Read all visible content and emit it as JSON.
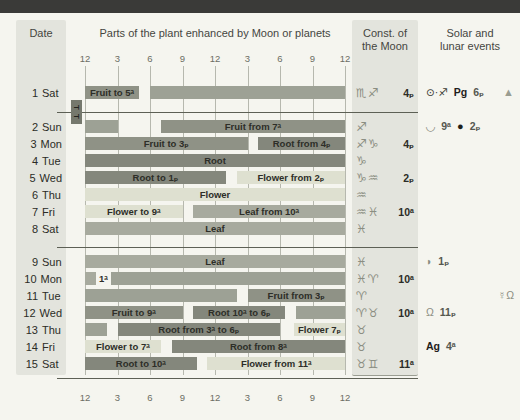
{
  "header": {
    "date_label": "Date",
    "plant_label": "Parts of the plant enhanced by Moon or planets",
    "const_line1": "Const. of",
    "const_line2": "the Moon",
    "events_line1": "Solar and",
    "events_line2": "lunar events"
  },
  "axis": {
    "labels": [
      "12",
      "3",
      "6",
      "9",
      "12",
      "3",
      "6",
      "9",
      "12"
    ],
    "hours": [
      0,
      3,
      6,
      9,
      12,
      15,
      18,
      21,
      24
    ]
  },
  "tt_marker": {
    "label": "T T"
  },
  "colors": {
    "fruit": "#8f9286",
    "root": "#84877c",
    "flower": "#dee0d0",
    "leaf": "#a7aa9e",
    "unfavorable": "#9da195",
    "header_bar": "#3a3a38",
    "column_band": "#e3e4dd",
    "grid": "#b6b8ae",
    "separator": "#5d6055",
    "symbol": "#8b8e82"
  },
  "rows": [
    {
      "date_num": "1",
      "date_day": "Sat",
      "bars": [
        {
          "type": "fruit",
          "from": 0,
          "to": 5,
          "label": "Fruit to 5ᵃ"
        },
        {
          "type": "gray",
          "from": 6,
          "to": 24,
          "label": ""
        }
      ],
      "constellation": {
        "signs": "♏♐",
        "time": "4ₚ"
      },
      "events": [
        {
          "n": "sun-into-sagittarius",
          "t": "⊙·♐",
          "k": "dark"
        },
        {
          "n": "perigee-label",
          "t": "Pg",
          "k": "bold"
        },
        {
          "n": "perigee-time",
          "t": "6ₚ",
          "k": "time"
        },
        {
          "n": "warning-triangle-icon",
          "t": "▲",
          "k": "sym tri right"
        }
      ]
    },
    {
      "date_num": "2",
      "date_day": "Sun",
      "bars": [
        {
          "type": "gray",
          "from": 0,
          "to": 3,
          "label": ""
        },
        {
          "type": "fruit",
          "from": 7,
          "to": 24,
          "label": "Fruit from 7ᵃ"
        }
      ],
      "constellation": {
        "signs": "♐",
        "time": ""
      },
      "events": [
        {
          "n": "eclipse-icon",
          "t": "◡",
          "k": "sym big"
        },
        {
          "n": "eclipse-time",
          "t": "9ᵃ",
          "k": "time"
        },
        {
          "n": "new-moon-icon",
          "t": "●",
          "k": "moon"
        },
        {
          "n": "new-moon-time",
          "t": "2ₚ",
          "k": "time"
        }
      ]
    },
    {
      "date_num": "3",
      "date_day": "Mon",
      "bars": [
        {
          "type": "fruit",
          "from": 0,
          "to": 15,
          "label": "Fruit to 3ₚ"
        },
        {
          "type": "root",
          "from": 16,
          "to": 24,
          "label": "Root from 4ₚ"
        }
      ],
      "constellation": {
        "signs": "♐♑",
        "time": "4ₚ"
      },
      "events": []
    },
    {
      "date_num": "4",
      "date_day": "Tue",
      "bars": [
        {
          "type": "root",
          "from": 0,
          "to": 24,
          "label": "Root"
        }
      ],
      "constellation": {
        "signs": "♑",
        "time": ""
      },
      "events": []
    },
    {
      "date_num": "5",
      "date_day": "Wed",
      "bars": [
        {
          "type": "root",
          "from": 0,
          "to": 13,
          "label": "Root to 1ₚ"
        },
        {
          "type": "flower",
          "from": 14,
          "to": 24,
          "label": "Flower from 2ₚ"
        }
      ],
      "constellation": {
        "signs": "♑♒",
        "time": "2ₚ"
      },
      "events": []
    },
    {
      "date_num": "6",
      "date_day": "Thu",
      "bars": [
        {
          "type": "flower",
          "from": 0,
          "to": 24,
          "label": "Flower"
        }
      ],
      "constellation": {
        "signs": "♒",
        "time": ""
      },
      "events": []
    },
    {
      "date_num": "7",
      "date_day": "Fri",
      "bars": [
        {
          "type": "flower",
          "from": 0,
          "to": 9,
          "label": "Flower to 9ᵃ"
        },
        {
          "type": "leaf",
          "from": 10,
          "to": 24,
          "label": "Leaf from 10ᵃ"
        }
      ],
      "constellation": {
        "signs": "♒♓",
        "time": "10ᵃ"
      },
      "events": []
    },
    {
      "date_num": "8",
      "date_day": "Sat",
      "bars": [
        {
          "type": "leaf",
          "from": 0,
          "to": 24,
          "label": "Leaf"
        }
      ],
      "constellation": {
        "signs": "♓",
        "time": ""
      },
      "events": []
    },
    {
      "date_num": "9",
      "date_day": "Sun",
      "bars": [
        {
          "type": "leaf",
          "from": 0,
          "to": 24,
          "label": "Leaf"
        }
      ],
      "constellation": {
        "signs": "♓",
        "time": ""
      },
      "events": [
        {
          "n": "first-quarter-moon-icon",
          "t": "◗",
          "k": "sym"
        },
        {
          "n": "first-quarter-time",
          "t": "1ₚ",
          "k": "time"
        }
      ]
    },
    {
      "date_num": "10",
      "date_day": "Mon",
      "bars": [
        {
          "type": "leaf",
          "from": 0,
          "to": 1,
          "label": ""
        },
        {
          "type": "note",
          "at": 1.3,
          "label": "1ᵃ"
        },
        {
          "type": "gray",
          "from": 2.4,
          "to": 24,
          "label": ""
        }
      ],
      "constellation": {
        "signs": "♓♈",
        "time": "10ᵃ"
      },
      "events": []
    },
    {
      "date_num": "11",
      "date_day": "Tue",
      "bars": [
        {
          "type": "gray",
          "from": 0,
          "to": 14,
          "label": ""
        },
        {
          "type": "fruit",
          "from": 15,
          "to": 24,
          "label": "Fruit from 3ₚ"
        }
      ],
      "constellation": {
        "signs": "♈",
        "time": ""
      },
      "events": [
        {
          "n": "mercury-node-icon",
          "t": "☿Ω",
          "k": "sym right"
        }
      ]
    },
    {
      "date_num": "12",
      "date_day": "Wed",
      "bars": [
        {
          "type": "fruit",
          "from": 0,
          "to": 9,
          "label": "Fruit to 9ᵃ"
        },
        {
          "type": "root",
          "from": 10,
          "to": 18.5,
          "label": "Root 10ᵃ to 6ₚ"
        },
        {
          "type": "gray",
          "from": 19.5,
          "to": 24,
          "label": ""
        }
      ],
      "constellation": {
        "signs": "♈♉",
        "time": "10ᵃ"
      },
      "events": [
        {
          "n": "ascending-node-icon",
          "t": "Ω",
          "k": "sym"
        },
        {
          "n": "node-time",
          "t": "11ₚ",
          "k": "time"
        }
      ]
    },
    {
      "date_num": "13",
      "date_day": "Thu",
      "bars": [
        {
          "type": "gray",
          "from": 0,
          "to": 2,
          "label": ""
        },
        {
          "type": "root",
          "from": 3,
          "to": 18,
          "label": "Root from 3ᵃ to 6ₚ"
        },
        {
          "type": "flower",
          "from": 19.3,
          "to": 24,
          "label": "Flower 7ₚ"
        }
      ],
      "constellation": {
        "signs": "♉",
        "time": ""
      },
      "events": []
    },
    {
      "date_num": "14",
      "date_day": "Fri",
      "bars": [
        {
          "type": "flower",
          "from": 0,
          "to": 7,
          "label": "Flower to 7ᵃ"
        },
        {
          "type": "root",
          "from": 8,
          "to": 24,
          "label": "Root from 8ᵃ"
        }
      ],
      "constellation": {
        "signs": "♉",
        "time": ""
      },
      "events": [
        {
          "n": "apogee-label",
          "t": "Ag",
          "k": "bold"
        },
        {
          "n": "apogee-time",
          "t": "4ᵃ",
          "k": "time"
        }
      ]
    },
    {
      "date_num": "15",
      "date_day": "Sat",
      "bars": [
        {
          "type": "root",
          "from": 0,
          "to": 10.3,
          "label": "Root to 10ᵃ"
        },
        {
          "type": "flower",
          "from": 11.3,
          "to": 24,
          "label": "Flower from 11ᵃ"
        }
      ],
      "constellation": {
        "signs": "♉♊",
        "time": "11ᵃ"
      },
      "events": []
    }
  ]
}
